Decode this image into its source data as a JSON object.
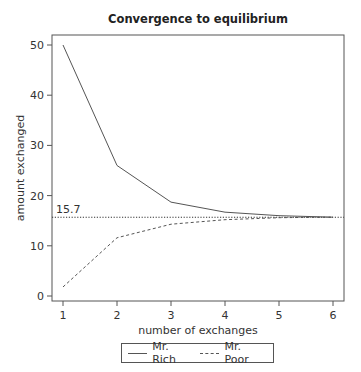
{
  "chart_data": {
    "type": "line",
    "title": "Convergence to equilibrium",
    "xlabel": "number of exchanges",
    "ylabel": "amount exchanged",
    "x": [
      1,
      2,
      3,
      4,
      5,
      6
    ],
    "xticks": [
      "1",
      "2",
      "3",
      "4",
      "5",
      "6"
    ],
    "yticks": [
      "0",
      "10",
      "20",
      "30",
      "40",
      "50"
    ],
    "xlim": [
      0.8,
      6.2
    ],
    "ylim": [
      -1,
      52
    ],
    "grid": false,
    "legend_position": "bottom",
    "series": [
      {
        "name": "Mr. Rich",
        "style": "solid",
        "values": [
          50,
          26,
          18.7,
          16.7,
          16.0,
          15.7
        ]
      },
      {
        "name": "Mr. Poor",
        "style": "dashed",
        "values": [
          1.8,
          11.6,
          14.3,
          15.2,
          15.6,
          15.7
        ]
      }
    ],
    "annotations": [
      {
        "type": "hline",
        "y": 15.7,
        "style": "dotted",
        "label": "15.7"
      }
    ]
  },
  "legend": {
    "items": [
      {
        "label": "Mr. Rich"
      },
      {
        "label": "Mr. Poor"
      }
    ]
  },
  "colors": {
    "line": "#555555",
    "axis": "#555555",
    "text": "#333333"
  }
}
